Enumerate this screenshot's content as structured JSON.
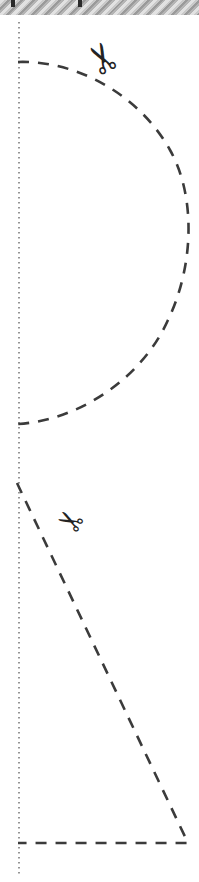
{
  "page": {
    "width": 199,
    "height": 882,
    "background_color": "#ffffff"
  },
  "hatch_band": {
    "label": "torn-edge-hatching",
    "height": 15,
    "stripe_angle_deg": -45,
    "colors": [
      "#9a9a9a",
      "#c9c9c9",
      "#e2e2e2",
      "#b4b4b4"
    ],
    "staples": [
      {
        "label": "staple-mark-1",
        "x": 11,
        "color": "#2b2b2b"
      },
      {
        "label": "staple-mark-2",
        "x": 78,
        "color": "#2b2b2b"
      }
    ]
  },
  "fold_line": {
    "label": "vertical-dotted-fold-line",
    "x": 19,
    "y_start": 22,
    "y_end": 876,
    "color": "#6a6a6a",
    "style": "dotted",
    "width": 1.4
  },
  "shapes": [
    {
      "id": "semicircle-cut",
      "label": "Dashed semicircular cut line",
      "style": "dashed",
      "color": "#3b3b3b",
      "stroke_width": 2.6,
      "dash": "11 9",
      "path": "M 18 62 C 78 60 140 96 170 150 C 196 196 194 266 168 320 C 142 378 80 420 18 424",
      "anchor_top": [
        18,
        62
      ],
      "anchor_bottom": [
        18,
        424
      ],
      "rightmost_x": 190
    },
    {
      "id": "triangle-cut",
      "label": "Dashed triangular cut line",
      "style": "dashed",
      "color": "#3b3b3b",
      "stroke_width": 2.6,
      "dash": "11 9",
      "path": "M 17 483 L 188 843 L 18 843",
      "vertices": [
        [
          17,
          483
        ],
        [
          188,
          843
        ],
        [
          18,
          843
        ]
      ]
    }
  ],
  "icons": [
    {
      "id": "scissors-top",
      "name": "scissors-icon",
      "glyph": "✂",
      "x": 86,
      "y": 38,
      "size": 40,
      "rotation_deg": -118,
      "color": "#232323"
    },
    {
      "id": "scissors-bottom",
      "name": "scissors-icon",
      "glyph": "✂",
      "x": 58,
      "y": 505,
      "size": 31,
      "rotation_deg": -152,
      "color": "#232323"
    }
  ]
}
